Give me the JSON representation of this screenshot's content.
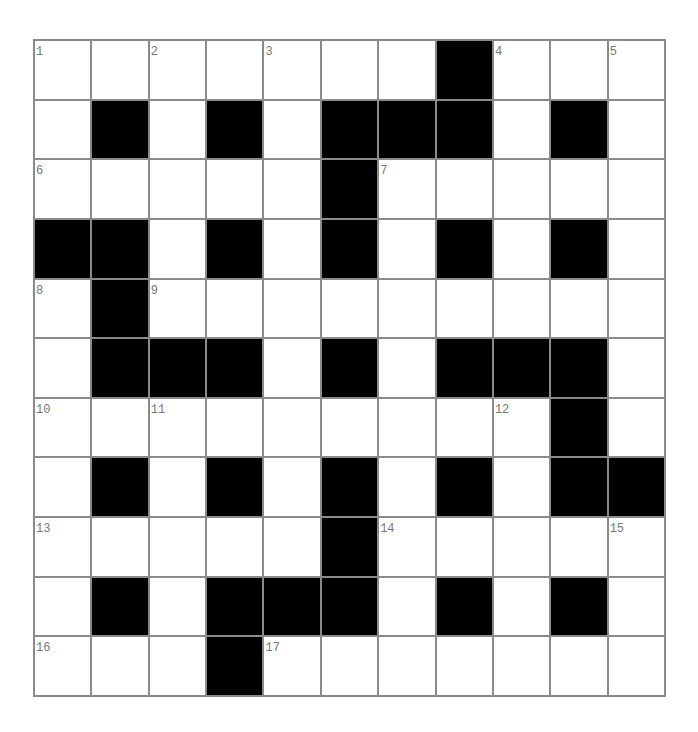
{
  "puzzle": {
    "title_fragment": "",
    "rows": 11,
    "cols": 11,
    "colors": {
      "black_cell": "#000000",
      "white_cell": "#ffffff",
      "grid_line": "#8a8a8a",
      "number_text": "#777777"
    },
    "layout": [
      ".......#...",
      ".#.#.###.#.",
      ".....#.....",
      "##.#.#.#.#.",
      ".#.........",
      ".###.#.###.",
      ".........#.",
      ".#.#.#.#.##",
      ".....#.....",
      ".#.###.#.#.",
      "...#......."
    ],
    "numbers": [
      {
        "row": 0,
        "col": 0,
        "n": "1"
      },
      {
        "row": 0,
        "col": 2,
        "n": "2"
      },
      {
        "row": 0,
        "col": 4,
        "n": "3"
      },
      {
        "row": 0,
        "col": 8,
        "n": "4"
      },
      {
        "row": 0,
        "col": 10,
        "n": "5"
      },
      {
        "row": 2,
        "col": 0,
        "n": "6"
      },
      {
        "row": 2,
        "col": 6,
        "n": "7"
      },
      {
        "row": 4,
        "col": 0,
        "n": "8"
      },
      {
        "row": 4,
        "col": 2,
        "n": "9"
      },
      {
        "row": 6,
        "col": 0,
        "n": "10"
      },
      {
        "row": 6,
        "col": 2,
        "n": "11"
      },
      {
        "row": 6,
        "col": 8,
        "n": "12"
      },
      {
        "row": 8,
        "col": 0,
        "n": "13"
      },
      {
        "row": 8,
        "col": 6,
        "n": "14"
      },
      {
        "row": 8,
        "col": 10,
        "n": "15"
      },
      {
        "row": 10,
        "col": 0,
        "n": "16"
      },
      {
        "row": 10,
        "col": 4,
        "n": "17"
      }
    ]
  }
}
